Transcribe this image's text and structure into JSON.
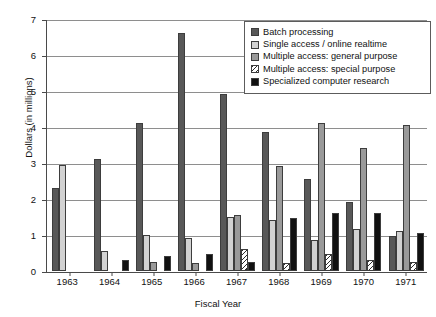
{
  "chart_data": {
    "type": "bar",
    "title": "",
    "xlabel": "Fiscal Year",
    "ylabel": "Dollars (in millions)",
    "ylim": [
      0,
      7
    ],
    "yticks": [
      0,
      1,
      2,
      3,
      4,
      5,
      6,
      7
    ],
    "ytick_labels": [
      "0",
      "1",
      "2",
      "3",
      "4",
      "5",
      "6",
      "7"
    ],
    "grid": true,
    "legend_position": "top-right",
    "categories": [
      "1963",
      "1964",
      "1965",
      "1966",
      "1967",
      "1968",
      "1969",
      "1970",
      "1971"
    ],
    "series": [
      {
        "name": "Batch processing",
        "color": "#585858",
        "pattern": "solid",
        "values": [
          2.3,
          3.1,
          4.1,
          6.6,
          4.9,
          3.85,
          2.55,
          1.9,
          0.95
        ]
      },
      {
        "name": "Single access / online realtime",
        "color": "#d2d2d2",
        "pattern": "solid",
        "values": [
          2.95,
          0.55,
          1.0,
          0.9,
          1.5,
          1.4,
          0.85,
          1.15,
          1.1
        ]
      },
      {
        "name": "Multiple access: general purpose",
        "color": "#9a9a9a",
        "pattern": "solid",
        "values": [
          0,
          0,
          0.25,
          0.2,
          1.55,
          2.9,
          4.1,
          3.4,
          4.05
        ]
      },
      {
        "name": "Multiple access: special purpose",
        "color": "#2c2c2c",
        "pattern": "diagonal-hatch",
        "values": [
          0,
          0,
          0,
          0,
          0.6,
          0.2,
          0.45,
          0.3,
          0.25
        ]
      },
      {
        "name": "Specialized computer research",
        "color": "#111111",
        "pattern": "solid",
        "values": [
          0,
          0.3,
          0.4,
          0.45,
          0.25,
          1.45,
          1.6,
          1.6,
          1.05
        ]
      }
    ]
  }
}
